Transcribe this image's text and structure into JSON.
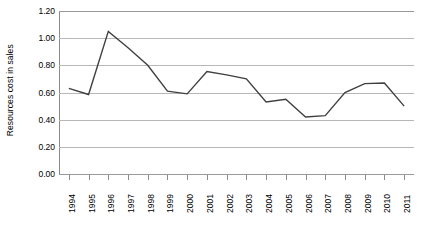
{
  "chart_data": {
    "type": "line",
    "title": "",
    "xlabel": "",
    "ylabel": "Resources cost in sales",
    "categories": [
      "1994",
      "1995",
      "1996",
      "1997",
      "1998",
      "1999",
      "2000",
      "2001",
      "2002",
      "2003",
      "2004",
      "2005",
      "2006",
      "2007",
      "2008",
      "2009",
      "2010",
      "2011"
    ],
    "values": [
      0.63,
      0.585,
      1.05,
      0.93,
      0.8,
      0.61,
      0.59,
      0.755,
      0.73,
      0.7,
      0.53,
      0.55,
      0.42,
      0.43,
      0.6,
      0.665,
      0.67,
      0.5
    ],
    "series": [
      {
        "name": "Resources cost in sales",
        "values": [
          0.63,
          0.585,
          1.05,
          0.93,
          0.8,
          0.61,
          0.59,
          0.755,
          0.73,
          0.7,
          0.53,
          0.55,
          0.42,
          0.43,
          0.6,
          0.665,
          0.67,
          0.5
        ],
        "color": "#404040"
      }
    ],
    "ylim": [
      0.0,
      1.2
    ],
    "ytick_labels": [
      "1.20",
      "1.00",
      "0.80",
      "0.60",
      "0.40",
      "0.20",
      "0.00"
    ],
    "ytick_values": [
      1.2,
      1.0,
      0.8,
      0.6,
      0.4,
      0.2,
      0.0
    ],
    "grid": true,
    "grid_color": "#b7b7b7",
    "legend": false,
    "legend_position": "none",
    "line_color": "#404040",
    "background_color": "#ffffff",
    "axis_color": "#8a8a8a",
    "markers": false
  }
}
